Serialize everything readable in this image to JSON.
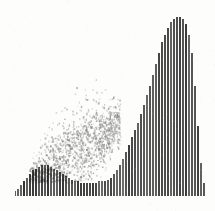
{
  "figure": {
    "title": "",
    "background_color": "#fdfdfc",
    "ink_color": "#4a4a4a",
    "cloud_color": "#8c8c8c",
    "plot": {
      "left": 15,
      "top": 13,
      "width": 190,
      "height": 183
    }
  },
  "chart_data": {
    "type": "bar",
    "title": "",
    "subtitle": "",
    "xlabel": "",
    "ylabel": "",
    "grid": false,
    "legend": null,
    "annotations": [],
    "axis_visible": false,
    "tick_labels_x": [],
    "tick_labels_y": [],
    "xlim": [
      0,
      64
    ],
    "ylim": [
      0,
      100
    ],
    "bar_width_px": 1.6,
    "bar_pitch_px": 3.0,
    "description": "Dense vertical hatch bars of full height across most of the field; bar tops are clipped from below by a valley-shaped envelope in the lower third, producing a white crescent/wing void at lower right. A diagonal grey noise cloud overlays the lower-left quadrant.",
    "categories": [
      "0",
      "1",
      "2",
      "3",
      "4",
      "5",
      "6",
      "7",
      "8",
      "9",
      "10",
      "11",
      "12",
      "13",
      "14",
      "15",
      "16",
      "17",
      "18",
      "19",
      "20",
      "21",
      "22",
      "23",
      "24",
      "25",
      "26",
      "27",
      "28",
      "29",
      "30",
      "31",
      "32",
      "33",
      "34",
      "35",
      "36",
      "37",
      "38",
      "39",
      "40",
      "41",
      "42",
      "43",
      "44",
      "45",
      "46",
      "47",
      "48",
      "49",
      "50",
      "51",
      "52",
      "53",
      "54",
      "55",
      "56",
      "57",
      "58",
      "59",
      "60",
      "61",
      "62",
      "63"
    ],
    "values": [
      100,
      100,
      100,
      100,
      100,
      100,
      100,
      100,
      100,
      100,
      100,
      100,
      100,
      100,
      100,
      100,
      100,
      100,
      100,
      100,
      100,
      100,
      100,
      100,
      100,
      100,
      100,
      100,
      100,
      100,
      100,
      100,
      100,
      100,
      100,
      100,
      100,
      100,
      100,
      100,
      100,
      100,
      100,
      100,
      100,
      100,
      100,
      100,
      100,
      100,
      100,
      100,
      100,
      100,
      100,
      100,
      100,
      100,
      100,
      100,
      100,
      100,
      100,
      100
    ],
    "baseline_cut": {
      "name": "lower-envelope",
      "comment": "fraction of bar removed from the bottom, 0 = full bar, 1 = no bar",
      "values": [
        0.97,
        0.96,
        0.94,
        0.92,
        0.9,
        0.88,
        0.86,
        0.85,
        0.84,
        0.83,
        0.83,
        0.83,
        0.84,
        0.85,
        0.86,
        0.87,
        0.88,
        0.89,
        0.9,
        0.91,
        0.92,
        0.92,
        0.93,
        0.93,
        0.93,
        0.93,
        0.93,
        0.93,
        0.92,
        0.92,
        0.92,
        0.91,
        0.9,
        0.88,
        0.86,
        0.83,
        0.8,
        0.76,
        0.72,
        0.68,
        0.64,
        0.6,
        0.55,
        0.5,
        0.45,
        0.4,
        0.34,
        0.28,
        0.22,
        0.16,
        0.12,
        0.08,
        0.05,
        0.03,
        0.02,
        0.02,
        0.03,
        0.06,
        0.12,
        0.22,
        0.4,
        0.62,
        0.82,
        0.93
      ]
    },
    "noise_cloud": {
      "name": "diagonal-scatter-cloud",
      "color": "#8c8c8c",
      "x_start_px": 14,
      "x_end_px": 105,
      "y_top_px": 118,
      "y_bottom_px": 182,
      "orientation": "diagonal-ascending",
      "density": 0.55
    }
  }
}
